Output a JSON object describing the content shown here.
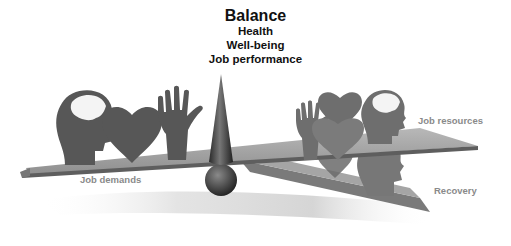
{
  "diagram": {
    "title": "Balance",
    "subtitles": [
      "Health",
      "Well-being",
      "Job performance"
    ],
    "left_side": {
      "label": "Job demands",
      "icons": [
        "head-brain-icon",
        "heart-icon",
        "hand-icon"
      ]
    },
    "right_side": {
      "upper_label": "Job resources",
      "lower_label": "Recovery",
      "icons": [
        "hand-icon",
        "heart-icon",
        "head-brain-icon"
      ]
    },
    "fulcrum": [
      "cone",
      "sphere"
    ],
    "colors": {
      "silhouette": "#5a5a5a",
      "plank": "#9a9a9a",
      "plank_edge": "#5e5e5e",
      "text": "#111111",
      "label": "#8a8a8a"
    }
  }
}
